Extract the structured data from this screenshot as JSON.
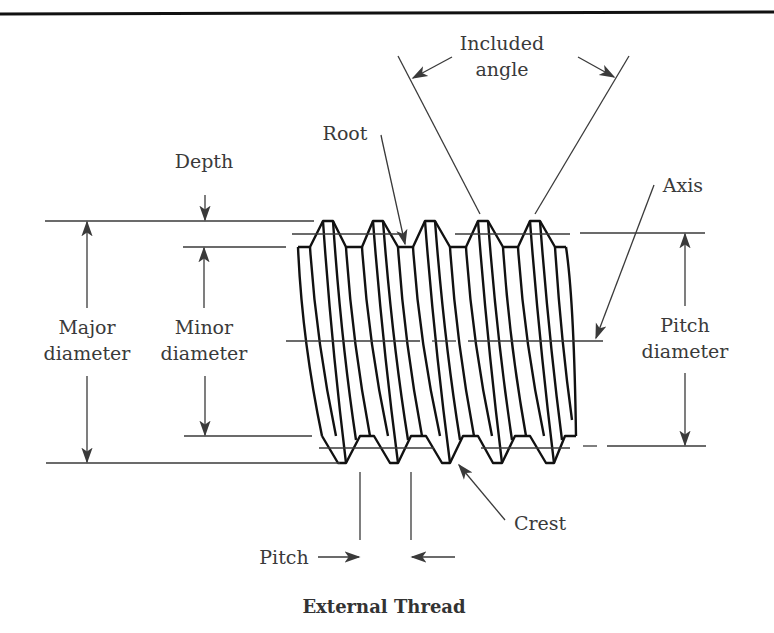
{
  "figure": {
    "title": "External Thread",
    "labels": {
      "included_angle_line1": "Included",
      "included_angle_line2": "angle",
      "root": "Root",
      "depth": "Depth",
      "axis": "Axis",
      "major_diameter_line1": "Major",
      "major_diameter_line2": "diameter",
      "minor_diameter_line1": "Minor",
      "minor_diameter_line2": "diameter",
      "pitch_diameter_line1": "Pitch",
      "pitch_diameter_line2": "diameter",
      "crest": "Crest",
      "pitch": "Pitch"
    },
    "colors": {
      "line": "#3a3a3a",
      "thread_outline": "#111111",
      "background": "#ffffff"
    }
  }
}
